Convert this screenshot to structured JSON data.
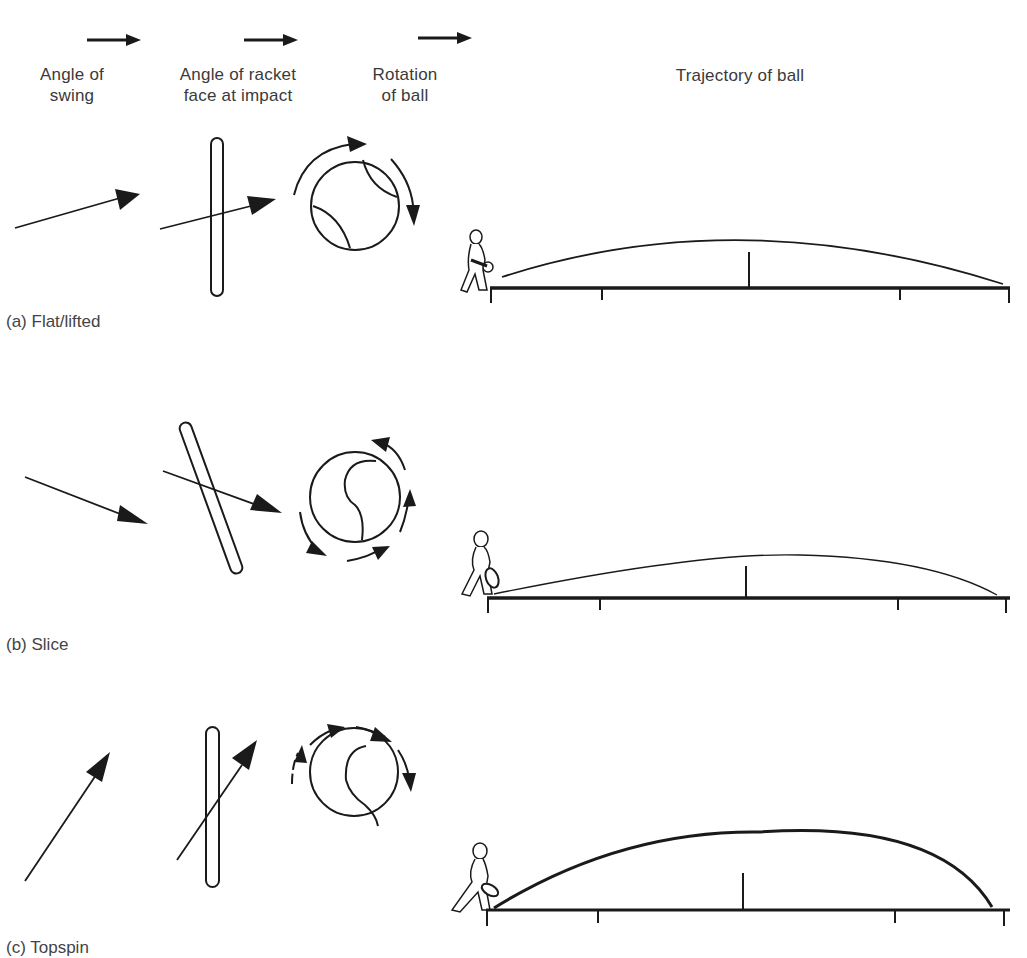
{
  "header": {
    "columns": [
      {
        "line1": "Angle of",
        "line2": "swing"
      },
      {
        "line1": "Angle of racket",
        "line2": "face at impact"
      },
      {
        "line1": "Rotation",
        "line2": "of ball"
      },
      {
        "line1": "Trajectory of ball",
        "line2": ""
      }
    ],
    "direction_icon": "arrow-right-icon"
  },
  "rows": [
    {
      "id": "a",
      "label": "(a) Flat/lifted",
      "swing": "slightly upward",
      "racket_face": "vertical",
      "rotation": "forward (topspin-lite)",
      "trajectory": "medium arc"
    },
    {
      "id": "b",
      "label": "(b) Slice",
      "swing": "downward",
      "racket_face": "open (tilted back)",
      "rotation": "backspin",
      "trajectory": "low flat arc"
    },
    {
      "id": "c",
      "label": "(c) Topspin",
      "swing": "steep upward",
      "racket_face": "vertical",
      "rotation": "forward spin",
      "trajectory": "high arc dropping steeply"
    }
  ],
  "colors": {
    "ink": "#1a1a1a",
    "text": "#3a3a3a",
    "background": "#ffffff"
  }
}
